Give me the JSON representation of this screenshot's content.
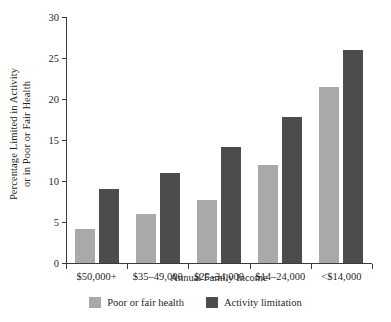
{
  "chart_data": {
    "type": "bar",
    "title": "",
    "xlabel": "Annual Family Income",
    "ylabel_line1": "Percentage Limited in Activity",
    "ylabel_line2": "or in Poor or Fair Health",
    "categories": [
      "$50,000+",
      "$35–49,000",
      "$25–34,000",
      "$14–24,000",
      "<$14,000"
    ],
    "series": [
      {
        "name": "Poor or fair health",
        "color": "#a9a9a9",
        "values": [
          4.2,
          6.0,
          7.7,
          12.0,
          21.5
        ]
      },
      {
        "name": "Activity limitation",
        "color": "#4c4c4c",
        "values": [
          9.0,
          11.0,
          14.2,
          17.8,
          26.0
        ]
      }
    ],
    "ylim": [
      0,
      30
    ],
    "yticks": [
      0,
      5,
      10,
      15,
      20,
      25,
      30
    ],
    "ytick_labels": [
      "0",
      "5",
      "10",
      "15",
      "20",
      "25",
      "30"
    ],
    "grid": false,
    "legend_position": "bottom"
  },
  "legend": {
    "items": [
      {
        "label": "Poor or fair health",
        "color": "#a9a9a9"
      },
      {
        "label": "Activity limitation",
        "color": "#4c4c4c"
      }
    ]
  }
}
